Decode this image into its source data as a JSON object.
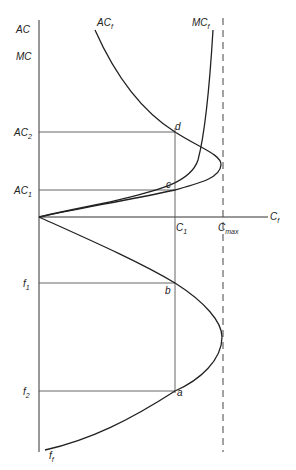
{
  "figure": {
    "y_axis_labels": [
      "AC",
      "MC"
    ],
    "x_axis_label": {
      "base": "C",
      "sub": "f"
    },
    "curve_labels": {
      "average_cost": {
        "base": "AC",
        "sub": "f"
      },
      "marginal_cost": {
        "base": "MC",
        "sub": "f"
      },
      "flow": {
        "base": "f",
        "sub": "f"
      }
    },
    "cost_levels": [
      {
        "base": "AC",
        "sub": "2"
      },
      {
        "base": "AC",
        "sub": "1"
      }
    ],
    "flow_levels": [
      {
        "base": "f",
        "sub": "1"
      },
      {
        "base": "f",
        "sub": "2"
      }
    ],
    "capacity_labels": {
      "c1": {
        "base": "C",
        "sub": "1"
      },
      "cmax": {
        "base": "C",
        "sub": "max"
      }
    },
    "points": [
      "d",
      "c",
      "b",
      "a"
    ]
  }
}
